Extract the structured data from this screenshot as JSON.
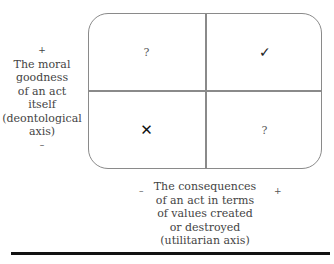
{
  "diagram": {
    "type": "2x2 matrix",
    "y_axis": {
      "plus": "+",
      "label_lines": [
        "The moral",
        "goodness",
        "of an act",
        "itself",
        "(deontological",
        "axis)"
      ],
      "minus": "–"
    },
    "x_axis": {
      "minus": "–",
      "label_lines": [
        "The consequences",
        "of an act in terms",
        "of values created",
        "or destroyed",
        "(utilitarian axis)"
      ],
      "plus": "+"
    },
    "cells": {
      "top_left": "?",
      "top_right": "✓",
      "bottom_left": "✕",
      "bottom_right": "?"
    }
  }
}
